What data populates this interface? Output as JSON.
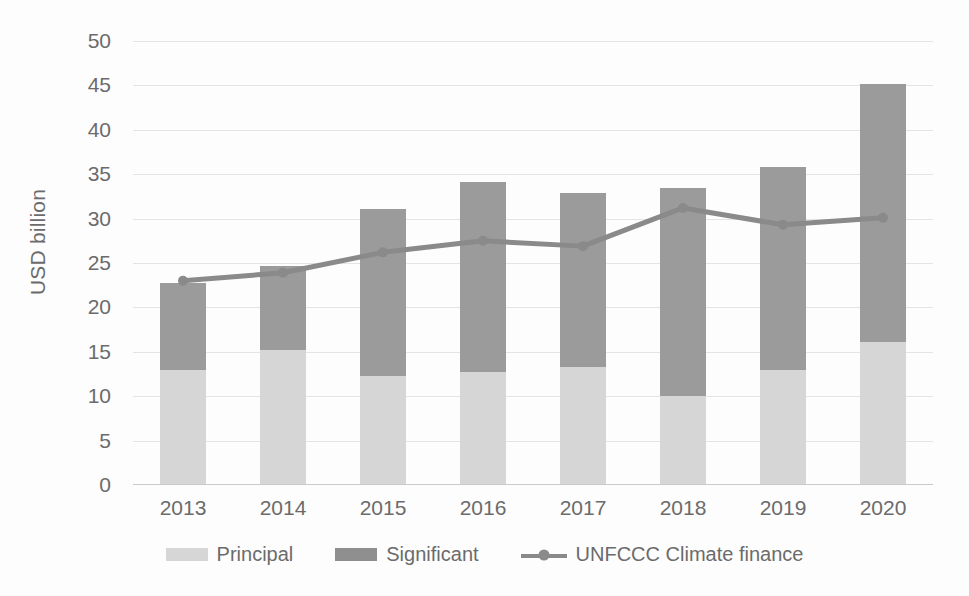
{
  "chart_data": {
    "type": "bar",
    "title": "",
    "subtitle": "",
    "xlabel": "",
    "ylabel": "USD billion",
    "ylim": [
      0,
      50
    ],
    "y_ticks": [
      0,
      5,
      10,
      15,
      20,
      25,
      30,
      35,
      40,
      45,
      50
    ],
    "grid": true,
    "legend_position": "bottom",
    "stacked": true,
    "categories": [
      "2013",
      "2014",
      "2015",
      "2016",
      "2017",
      "2018",
      "2019",
      "2020"
    ],
    "series": [
      {
        "name": "Principal",
        "type": "bar",
        "color": "#d6d6d6",
        "values": [
          13.0,
          15.2,
          12.3,
          12.7,
          13.3,
          10.0,
          13.0,
          16.1
        ]
      },
      {
        "name": "Significant",
        "type": "bar",
        "color": "#9b9b9b",
        "values": [
          9.8,
          9.5,
          18.8,
          21.4,
          19.6,
          23.4,
          22.8,
          29.1
        ]
      },
      {
        "name": "UNFCCC Climate finance",
        "type": "line",
        "color": "#8a8a8a",
        "values": [
          23.0,
          23.9,
          26.2,
          27.5,
          26.9,
          31.2,
          29.3,
          30.1
        ]
      }
    ],
    "stack_totals": [
      22.8,
      24.7,
      31.1,
      34.1,
      32.9,
      33.4,
      35.8,
      45.2
    ],
    "annotations": []
  },
  "legend": {
    "items": [
      {
        "label": "Principal",
        "marker": "bar-swatch-icon"
      },
      {
        "label": "Significant",
        "marker": "bar-swatch-icon"
      },
      {
        "label": "UNFCCC Climate finance",
        "marker": "line-marker-icon"
      }
    ]
  },
  "axes": {
    "y_title": "USD billion",
    "y_tick_labels": [
      "50",
      "45",
      "40",
      "35",
      "30",
      "25",
      "20",
      "15",
      "10",
      "5",
      "0"
    ],
    "x_tick_labels": [
      "2013",
      "2014",
      "2015",
      "2016",
      "2017",
      "2018",
      "2019",
      "2020"
    ]
  },
  "colors": {
    "principal": "#d6d6d6",
    "significant": "#9b9b9b",
    "line": "#8a8a8a",
    "grid": "#e4e4e4",
    "text": "#6b6b6b",
    "background": "#ffffff"
  }
}
